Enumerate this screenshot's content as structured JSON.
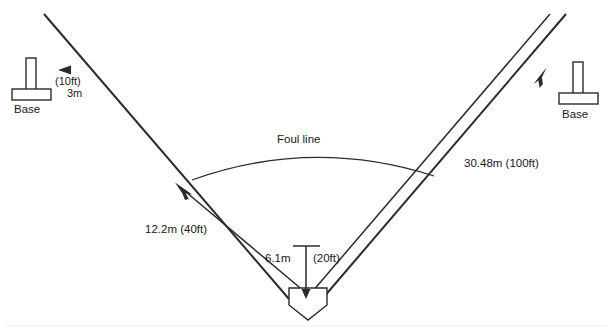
{
  "diagram": {
    "background_color": "#ffffff",
    "line_color": "#2b2b2b",
    "text_color": "#1a1a1a",
    "footer_rule_color": "#ececed"
  },
  "labels": {
    "foul_line": "Foul line",
    "left_base": "Base",
    "right_base": "Base",
    "right_distance": "30.48m (100ft)",
    "left_distance": "12.2m (40ft)",
    "plate_distance_metric": "6.1m",
    "plate_distance_imperial": "(20ft)",
    "base_offset_imperial": "(10ft)",
    "base_offset_metric": "3m"
  },
  "measurements": {
    "foul_line_length_m": 30.48,
    "foul_line_length_ft": 100,
    "left_mark_distance_m": 12.2,
    "left_mark_distance_ft": 40,
    "plate_width_m": 6.1,
    "plate_width_ft": 20,
    "base_offset_m": 3,
    "base_offset_ft": 10
  },
  "icons": {
    "home_plate": "home-plate-icon",
    "base_marker": "base-marker-icon",
    "arrow": "arrow-icon"
  }
}
